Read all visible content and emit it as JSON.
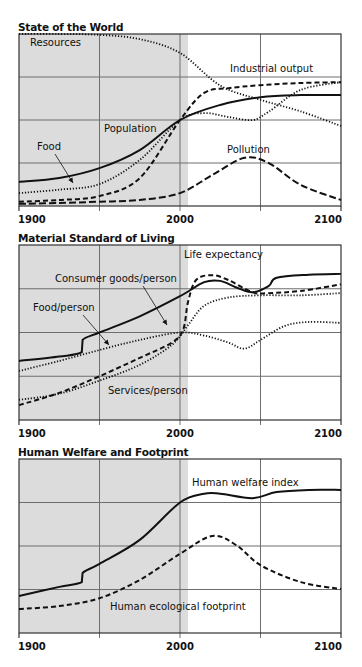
{
  "colors": {
    "shade": "#dcdcdc",
    "grid": "#6e6e6e",
    "line": "#111111",
    "background": "#ffffff"
  },
  "chart_data": [
    {
      "type": "line",
      "title": "State of the World",
      "xlabel": "",
      "ylabel": "",
      "xlim": [
        1900,
        2100
      ],
      "ylim": [
        0,
        4
      ],
      "grid": true,
      "legend_position": "inline labels",
      "shaded_region": [
        1900,
        2005
      ],
      "x_ticks": [
        "1900",
        "2000",
        "2100"
      ],
      "series": [
        {
          "name": "Resources",
          "style": "dotted",
          "x": [
            1900,
            1925,
            1950,
            1975,
            2000,
            2025,
            2050,
            2075,
            2100
          ],
          "values": [
            4.0,
            4.0,
            3.98,
            3.88,
            3.56,
            2.8,
            2.47,
            2.2,
            1.86
          ]
        },
        {
          "name": "Industrial output",
          "style": "dashed",
          "x": [
            1900,
            1925,
            1950,
            1975,
            2000,
            2015,
            2030,
            2050,
            2075,
            2100
          ],
          "values": [
            0.1,
            0.14,
            0.23,
            0.65,
            2.0,
            2.63,
            2.74,
            2.81,
            2.86,
            2.88
          ]
        },
        {
          "name": "Population",
          "style": "solid",
          "x": [
            1900,
            1925,
            1950,
            1975,
            2000,
            2025,
            2050,
            2075,
            2100
          ],
          "values": [
            0.56,
            0.65,
            0.88,
            1.3,
            2.0,
            2.35,
            2.53,
            2.58,
            2.58
          ]
        },
        {
          "name": "Food",
          "style": "dotted",
          "x": [
            1900,
            1925,
            1950,
            1975,
            2000,
            2015,
            2030,
            2045,
            2055,
            2075,
            2100
          ],
          "values": [
            0.3,
            0.38,
            0.51,
            1.07,
            2.0,
            2.16,
            2.07,
            2.0,
            2.19,
            2.7,
            2.88
          ]
        },
        {
          "name": "Pollution",
          "style": "longdash",
          "x": [
            1900,
            1925,
            1950,
            1975,
            2000,
            2020,
            2040,
            2055,
            2075,
            2100
          ],
          "values": [
            0.05,
            0.07,
            0.1,
            0.14,
            0.3,
            0.72,
            1.12,
            1.0,
            0.49,
            0.14
          ]
        }
      ]
    },
    {
      "type": "line",
      "title": "Material Standard of Living",
      "xlabel": "",
      "ylabel": "",
      "xlim": [
        1900,
        2100
      ],
      "ylim": [
        0,
        4
      ],
      "grid": true,
      "legend_position": "inline labels",
      "shaded_region": [
        1900,
        2005
      ],
      "x_ticks": [
        "1900",
        "2000",
        "2100"
      ],
      "series": [
        {
          "name": "Life expectancy",
          "style": "solid",
          "x": [
            1900,
            1925,
            1939,
            1939.5,
            1950,
            1975,
            2000,
            2015,
            2025,
            2035,
            2045,
            2055,
            2060,
            2080,
            2100
          ],
          "values": [
            1.35,
            1.45,
            1.55,
            1.83,
            2.0,
            2.37,
            2.83,
            3.15,
            3.18,
            3.03,
            2.92,
            3.06,
            3.25,
            3.32,
            3.34
          ]
        },
        {
          "name": "Consumer goods/person",
          "style": "dashed",
          "x": [
            1900,
            1925,
            1950,
            1975,
            1995,
            2002,
            2005,
            2010,
            2020,
            2030,
            2045,
            2055,
            2075,
            2100
          ],
          "values": [
            0.34,
            0.62,
            1.0,
            1.42,
            1.77,
            2.07,
            2.7,
            3.2,
            3.31,
            3.2,
            2.92,
            2.9,
            2.95,
            3.1
          ]
        },
        {
          "name": "Food/person",
          "style": "dotted",
          "x": [
            1900,
            1925,
            1950,
            1975,
            2000,
            2015,
            2030,
            2040,
            2050,
            2065,
            2080,
            2100
          ],
          "values": [
            1.12,
            1.35,
            1.6,
            1.83,
            2.0,
            1.93,
            1.77,
            1.63,
            1.83,
            2.15,
            2.24,
            2.22
          ]
        },
        {
          "name": "Services/person",
          "style": "dotted",
          "x": [
            1900,
            1925,
            1950,
            1975,
            1995,
            2005,
            2015,
            2030,
            2050,
            2075,
            2100
          ],
          "values": [
            0.46,
            0.6,
            0.9,
            1.26,
            1.72,
            2.17,
            2.61,
            2.8,
            2.85,
            2.85,
            2.9
          ]
        }
      ]
    },
    {
      "type": "line",
      "title": "Human Welfare and Footprint",
      "xlabel": "",
      "ylabel": "",
      "xlim": [
        1900,
        2100
      ],
      "ylim": [
        0,
        4
      ],
      "grid": true,
      "legend_position": "inline labels",
      "shaded_region": [
        1900,
        2005
      ],
      "x_ticks": [
        "1900",
        "2000",
        "2100"
      ],
      "series": [
        {
          "name": "Human welfare index",
          "style": "solid",
          "x": [
            1900,
            1925,
            1939,
            1939.5,
            1950,
            1975,
            2000,
            2015,
            2025,
            2045,
            2060,
            2080,
            2100
          ],
          "values": [
            0.85,
            1.06,
            1.17,
            1.38,
            1.59,
            2.14,
            3.0,
            3.2,
            3.2,
            3.1,
            3.24,
            3.29,
            3.29
          ]
        },
        {
          "name": "Human ecological footprint",
          "style": "dashed",
          "x": [
            1900,
            1925,
            1950,
            1975,
            2000,
            2020,
            2035,
            2050,
            2075,
            2100
          ],
          "values": [
            0.55,
            0.62,
            0.8,
            1.22,
            1.82,
            2.23,
            2.02,
            1.56,
            1.17,
            1.01
          ]
        }
      ]
    }
  ],
  "labels": [
    [
      {
        "text": "Resources",
        "x": 30,
        "y": 46
      },
      {
        "text": "Industrial output",
        "x": 230,
        "y": 72
      },
      {
        "text": "Population",
        "x": 104,
        "y": 132
      },
      {
        "text": "Food",
        "x": 37,
        "y": 150,
        "arrow": [
          55,
          154,
          73,
          183
        ]
      },
      {
        "text": "Pollution",
        "x": 227,
        "y": 153
      }
    ],
    [
      {
        "text": "Life expectancy",
        "x": 184,
        "y": 258
      },
      {
        "text": "Consumer goods/person",
        "x": 55,
        "y": 282,
        "arrow": [
          143,
          286,
          167,
          325
        ]
      },
      {
        "text": "Food/person",
        "x": 33,
        "y": 311,
        "arrow": [
          83,
          315,
          109,
          345
        ]
      },
      {
        "text": "Services/person",
        "x": 108,
        "y": 394
      }
    ],
    [
      {
        "text": "Human welfare index",
        "x": 192,
        "y": 486
      },
      {
        "text": "Human ecological footprint",
        "x": 110,
        "y": 610
      }
    ]
  ]
}
